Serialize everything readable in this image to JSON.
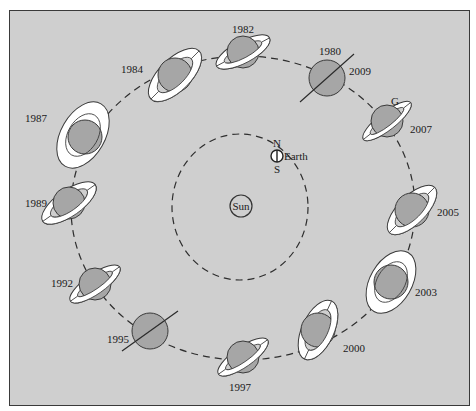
{
  "diagram": {
    "colors": {
      "background": "#cfcfcf",
      "planet_fill": "#a6a6a6",
      "ring_fill": "#ffffff",
      "outline": "#3a3a3a"
    },
    "center": {
      "label": "Sun"
    },
    "earth": {
      "label": "Earth",
      "north_label": "N",
      "south_label": "S"
    },
    "saturn_positions": [
      {
        "id": "p1982",
        "years": [
          "1982"
        ],
        "ring_view": "tilted"
      },
      {
        "id": "p1980",
        "years": [
          "1980",
          "2009"
        ],
        "ring_view": "edge-on"
      },
      {
        "id": "p2007",
        "years": [
          "2007"
        ],
        "ring_view": "tilted",
        "extra_label": "G"
      },
      {
        "id": "p2005",
        "years": [
          "2005"
        ],
        "ring_view": "tilted"
      },
      {
        "id": "p2003",
        "years": [
          "2003"
        ],
        "ring_view": "wide-open"
      },
      {
        "id": "p2000",
        "years": [
          "2000"
        ],
        "ring_view": "tilted"
      },
      {
        "id": "p1997",
        "years": [
          "1997"
        ],
        "ring_view": "tilted"
      },
      {
        "id": "p1995",
        "years": [
          "1995"
        ],
        "ring_view": "edge-on"
      },
      {
        "id": "p1992",
        "years": [
          "1992"
        ],
        "ring_view": "tilted"
      },
      {
        "id": "p1989",
        "years": [
          "1989"
        ],
        "ring_view": "tilted"
      },
      {
        "id": "p1987",
        "years": [
          "1987"
        ],
        "ring_view": "wide-open"
      },
      {
        "id": "p1984",
        "years": [
          "1984"
        ],
        "ring_view": "tilted"
      }
    ],
    "labels": {
      "y1982": "1982",
      "y1980": "1980",
      "y2009": "2009",
      "g": "G",
      "y2007": "2007",
      "y2005": "2005",
      "y2003": "2003",
      "y2000": "2000",
      "y1997": "1997",
      "y1995": "1995",
      "y1992": "1992",
      "y1989": "1989",
      "y1987": "1987",
      "y1984": "1984"
    }
  }
}
